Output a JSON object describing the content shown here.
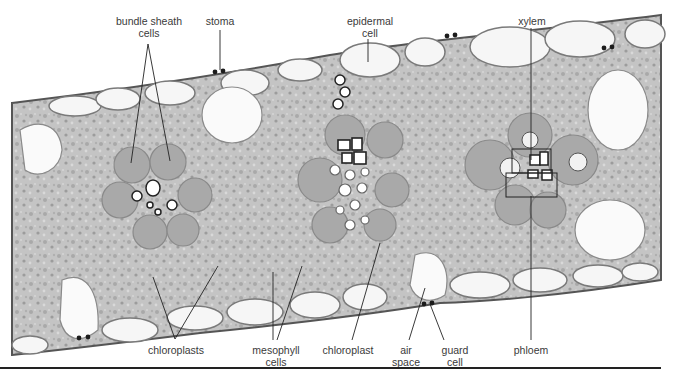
{
  "figure": {
    "labels": {
      "bundle_sheath": "bundle sheath\ncells",
      "bundle_sheath_l1": "bundle sheath",
      "bundle_sheath_l2": "cells",
      "stoma": "stoma",
      "epidermal_l1": "epidermal",
      "epidermal_l2": "cell",
      "xylem": "xylem",
      "chloroplasts": "chloroplasts",
      "mesophyll_l1": "mesophyll",
      "mesophyll_l2": "cells",
      "chloroplast": "chloroplast",
      "air_l1": "air",
      "air_l2": "space",
      "guard_l1": "guard",
      "guard_l2": "cell",
      "phloem": "phloem"
    },
    "colors": {
      "tissue": "#bdbdbd",
      "cell_wall": "#6e6e6e",
      "epidermis": "#f4f4f4",
      "leader_line": "#222222",
      "label_text": "#3a3a3a"
    }
  }
}
